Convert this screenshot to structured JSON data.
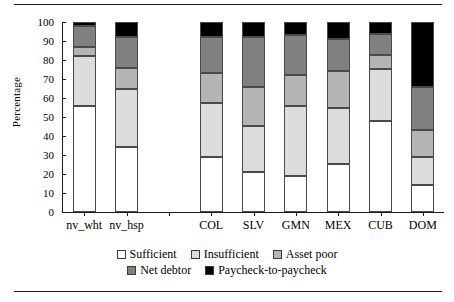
{
  "chart_data": {
    "type": "bar",
    "subtype": "stacked-bar-100",
    "title": "",
    "xlabel": "",
    "ylabel": "Percentage",
    "ylim": [
      0,
      100
    ],
    "yticks": [
      0,
      10,
      20,
      30,
      40,
      50,
      60,
      70,
      80,
      90,
      100
    ],
    "grid": false,
    "legend_position": "bottom",
    "categories": [
      "nv_wht",
      "nv_hsp",
      "COL",
      "SLV",
      "GMN",
      "MEX",
      "CUB",
      "DOM"
    ],
    "series": [
      {
        "name": "Sufficient",
        "color": "#ffffff",
        "values": [
          56,
          34,
          29,
          21,
          19,
          25.5,
          48,
          14
        ]
      },
      {
        "name": "Insufficient",
        "color": "#dcdcdc",
        "values": [
          26,
          31,
          28.5,
          24.5,
          37,
          29,
          27.5,
          15
        ]
      },
      {
        "name": "Asset poor",
        "color": "#b4b4b4",
        "values": [
          5,
          11,
          15.5,
          20.5,
          16,
          19.5,
          7,
          14
        ]
      },
      {
        "name": "Net debtor",
        "color": "#808080",
        "values": [
          11,
          16,
          19,
          26,
          21,
          17,
          11,
          23
        ]
      },
      {
        "name": "Paycheck-to-paycheck",
        "color": "#000000",
        "values": [
          2,
          8,
          8,
          8,
          7,
          9,
          6.5,
          34
        ]
      }
    ],
    "bar_gap_after_index": 1
  },
  "legend": {
    "rows": [
      [
        "Sufficient",
        "Insufficient",
        "Asset poor"
      ],
      [
        "Net debtor",
        "Paycheck-to-paycheck"
      ]
    ]
  }
}
